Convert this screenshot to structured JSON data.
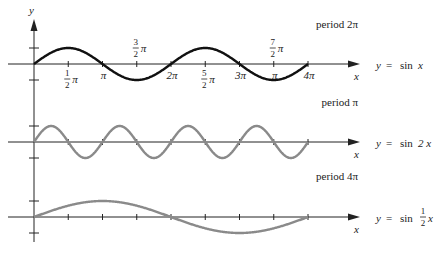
{
  "chart_data": [
    {
      "type": "line",
      "title": "period 2π",
      "equation": {
        "prefix": "y =",
        "func": "sin",
        "arg": "x"
      },
      "function": "sin(x)",
      "color": "#111111",
      "xlabel": "x",
      "ylabel": "y",
      "xlim": [
        "0",
        "4π"
      ],
      "xlim_numeric": [
        0,
        12.566
      ],
      "ylim": [
        -1,
        1
      ],
      "ytick_values": [
        -1,
        1
      ],
      "xtick_labels_above": [
        {
          "value_pi": 1.5,
          "num": "3",
          "den": "2",
          "sym": "π"
        },
        {
          "value_pi": 3.5,
          "num": "7",
          "den": "2",
          "sym": "π"
        }
      ],
      "xtick_labels_below": [
        {
          "value_pi": 0.5,
          "num": "1",
          "den": "2",
          "sym": "π"
        },
        {
          "value_pi": 1,
          "text": "π"
        },
        {
          "value_pi": 2,
          "text": "2π"
        },
        {
          "value_pi": 2.5,
          "num": "5",
          "den": "2",
          "sym": "π"
        },
        {
          "value_pi": 3,
          "text": "3π"
        },
        {
          "value_pi": 3.5,
          "text": "π"
        },
        {
          "value_pi": 4,
          "text": "4π"
        }
      ]
    },
    {
      "type": "line",
      "title": "period π",
      "equation": {
        "prefix": "y =",
        "func": "sin",
        "arg": "2 x"
      },
      "function": "sin(2x)",
      "color": "#8a8a8a",
      "xlabel": "x",
      "xlim": [
        "0",
        "4π"
      ],
      "xlim_numeric": [
        0,
        12.566
      ],
      "ylim": [
        -1,
        1
      ],
      "ytick_values": [
        -1,
        1
      ],
      "xtick_values_pi": [
        0.5,
        1,
        1.5,
        2,
        2.5,
        3,
        3.5,
        4
      ]
    },
    {
      "type": "line",
      "title": "period 4π",
      "equation": {
        "prefix": "y =",
        "func": "sin",
        "num": "1",
        "den": "2",
        "arg": "x"
      },
      "function": "sin(x/2)",
      "color": "#8a8a8a",
      "xlabel": "x",
      "xlim": [
        "0",
        "4π"
      ],
      "xlim_numeric": [
        0,
        12.566
      ],
      "ylim": [
        -1,
        1
      ],
      "ytick_values": [
        -1,
        1
      ],
      "xtick_values_pi": [
        0.5,
        1,
        1.5,
        2,
        2.5,
        3,
        3.5,
        4
      ]
    }
  ]
}
